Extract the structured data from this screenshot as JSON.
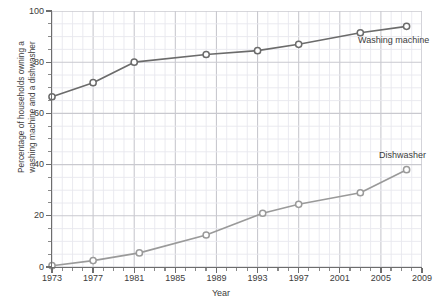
{
  "chart_data": {
    "type": "line",
    "title": "",
    "xlabel": "Year",
    "ylabel": "Percentage of households owning a washing machine and a dishwasher",
    "ylabel_line1": "Percentage of households owning a",
    "ylabel_line2": "washing machine and a dishwasher",
    "xlim": [
      1973,
      2009
    ],
    "ylim": [
      0,
      100
    ],
    "grid": true,
    "legend_position": "inline-annotation",
    "x_major_ticks": [
      1973,
      1977,
      1981,
      1985,
      1989,
      1993,
      1997,
      2001,
      2005,
      2009
    ],
    "x_minor_tick_step": 1,
    "y_major_ticks": [
      0,
      20,
      40,
      60,
      80,
      100
    ],
    "y_minor_tick_step": 5,
    "series": [
      {
        "name": "Washing machine",
        "color": "#6b6b6b",
        "annotation": "Washing machine",
        "x": [
          1973,
          1977,
          1981,
          1988,
          1993,
          1997,
          2003,
          2007.5
        ],
        "values": [
          66.5,
          72,
          80,
          83,
          84.5,
          87,
          91.5,
          94
        ]
      },
      {
        "name": "Dishwasher",
        "color": "#9a9a9a",
        "annotation": "Dishwasher",
        "x": [
          1973,
          1977,
          1981.5,
          1988,
          1993.5,
          1997,
          2003,
          2007.5
        ],
        "values": [
          0.5,
          2.5,
          5.5,
          12.5,
          21,
          24.5,
          29,
          38
        ]
      }
    ]
  },
  "axis": {
    "x_tick_labels": [
      "1973",
      "1977",
      "1981",
      "1985",
      "1989",
      "1993",
      "1997",
      "2001",
      "2005",
      "2009"
    ],
    "y_tick_labels": [
      "0",
      "20",
      "40",
      "60",
      "80",
      "100"
    ],
    "x_title": "Year",
    "y_title_line1": "Percentage of households owning a",
    "y_title_line2": "washing machine and a dishwasher"
  },
  "annotations": {
    "washing_machine": "Washing machine",
    "dishwasher": "Dishwasher"
  },
  "colors": {
    "washing_machine": "#6b6b6b",
    "dishwasher": "#9a9a9a",
    "axis": "#6d6d6d",
    "grid_major": "#c9c9cf",
    "grid_minor": "#e8e8ee",
    "text": "#3c3c3c",
    "background": "#ffffff"
  }
}
